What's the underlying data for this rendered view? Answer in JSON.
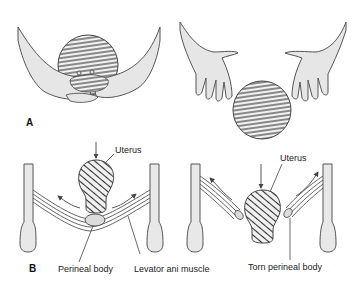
{
  "figure": {
    "panels": [
      {
        "letter": "A",
        "description": "Hands supporting the perineum during crowning (left) and hands-off approach (right)"
      },
      {
        "letter": "B",
        "description": "Uterus pressing down on pelvic floor: intact perineal body (left) and torn perineal body (right)"
      }
    ],
    "labels": {
      "uterus_left": "Uterus",
      "uterus_right": "Uterus",
      "perineal_body": "Perineal body",
      "levator_ani": "Levator ani muscle",
      "torn_perineal_body": "Torn perineal body"
    },
    "colors": {
      "skin_fill": "#e6e6e6",
      "outline": "#555555",
      "hatch": "#333333",
      "bone_fill": "#e8e8e8",
      "perineal_body_fill": "#dcdcdc",
      "text": "#222222"
    }
  }
}
